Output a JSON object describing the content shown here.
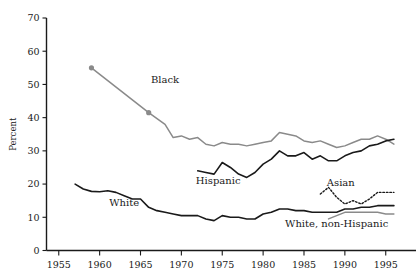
{
  "chart_data": {
    "type": "line",
    "title": "",
    "xlabel": "",
    "ylabel": "Percent",
    "xlim": [
      1953.5,
      1996.5
    ],
    "ylim": [
      0,
      70
    ],
    "grid": false,
    "legend": "inline-annotations",
    "xticks": [
      1955,
      1960,
      1965,
      1970,
      1975,
      1980,
      1985,
      1990,
      1995
    ],
    "yticks": [
      0,
      10,
      20,
      30,
      40,
      50,
      60,
      70
    ],
    "xtick_labels": [
      "1955",
      "1960",
      "1965",
      "1970",
      "1975",
      "1980",
      "1985",
      "1990",
      "1995"
    ],
    "ytick_labels": [
      "0",
      "10",
      "20",
      "30",
      "40",
      "50",
      "60",
      "70"
    ],
    "series": [
      {
        "name": "Black",
        "label": "Black",
        "color": "#8a8a8a",
        "style": "solid",
        "width": 1.5,
        "markers": [
          {
            "x": 1959,
            "y": 55.0
          },
          {
            "x": 1966,
            "y": 41.5
          }
        ],
        "label_x": 1968.0,
        "label_y": 50.5,
        "x": [
          1959,
          1966,
          1968,
          1969,
          1970,
          1971,
          1972,
          1973,
          1974,
          1975,
          1976,
          1977,
          1978,
          1979,
          1980,
          1981,
          1982,
          1983,
          1984,
          1985,
          1986,
          1987,
          1988,
          1989,
          1990,
          1991,
          1992,
          1993,
          1994,
          1995,
          1996
        ],
        "y": [
          55.0,
          41.5,
          38.0,
          34.0,
          34.5,
          33.5,
          34.0,
          32.0,
          31.5,
          32.5,
          32.0,
          32.0,
          31.5,
          32.0,
          32.5,
          33.0,
          35.5,
          35.0,
          34.5,
          33.0,
          32.5,
          33.0,
          32.0,
          31.0,
          31.5,
          32.5,
          33.5,
          33.5,
          34.5,
          33.5,
          32.0
        ]
      },
      {
        "name": "Hispanic",
        "label": "Hispanic",
        "color": "#1a1a1a",
        "style": "solid",
        "width": 1.6,
        "markers": [],
        "label_x": 1974.5,
        "label_y": 20.0,
        "x": [
          1972,
          1973,
          1974,
          1975,
          1976,
          1977,
          1978,
          1979,
          1980,
          1981,
          1982,
          1983,
          1984,
          1985,
          1986,
          1987,
          1988,
          1989,
          1990,
          1991,
          1992,
          1993,
          1994,
          1995,
          1996
        ],
        "y": [
          24.0,
          23.5,
          23.0,
          26.5,
          25.0,
          23.0,
          22.0,
          23.5,
          26.0,
          27.5,
          30.0,
          28.5,
          28.5,
          29.5,
          27.5,
          28.5,
          27.0,
          27.0,
          28.5,
          29.5,
          30.0,
          31.5,
          32.0,
          33.0,
          33.5
        ]
      },
      {
        "name": "White",
        "label": "White",
        "color": "#1a1a1a",
        "style": "solid",
        "width": 1.6,
        "markers": [],
        "label_x": 1963.0,
        "label_y": 13.5,
        "x": [
          1957,
          1958,
          1959,
          1960,
          1961,
          1962,
          1963,
          1964,
          1965,
          1966,
          1967,
          1968,
          1969,
          1970,
          1971,
          1972,
          1973,
          1974,
          1975,
          1976,
          1977,
          1978,
          1979,
          1980,
          1981,
          1982,
          1983,
          1984,
          1985,
          1986,
          1987,
          1988,
          1989,
          1990,
          1991,
          1992,
          1993,
          1994,
          1995,
          1996
        ],
        "y": [
          20.0,
          18.5,
          17.8,
          17.7,
          18.0,
          17.5,
          16.5,
          15.5,
          15.5,
          13.0,
          12.0,
          11.5,
          11.0,
          10.5,
          10.5,
          10.5,
          9.5,
          9.0,
          10.5,
          10.0,
          10.0,
          9.5,
          9.5,
          11.0,
          11.5,
          12.5,
          12.5,
          12.0,
          12.0,
          11.5,
          11.5,
          11.5,
          11.5,
          12.5,
          12.5,
          13.0,
          13.0,
          13.5,
          13.5,
          13.5
        ]
      },
      {
        "name": "Asian",
        "label": "Asian",
        "color": "#1a1a1a",
        "style": "dotted",
        "width": 1.4,
        "markers": [],
        "label_x": 1989.5,
        "label_y": 19.5,
        "x": [
          1987,
          1988,
          1989,
          1990,
          1991,
          1992,
          1993,
          1994,
          1995,
          1996
        ],
        "y": [
          17.0,
          19.0,
          16.0,
          14.0,
          15.0,
          14.0,
          15.5,
          17.5,
          17.5,
          17.5
        ]
      },
      {
        "name": "White, non-Hispanic",
        "label": "White, non-Hispanic",
        "color": "#8a8a8a",
        "style": "solid",
        "width": 1.4,
        "markers": [],
        "label_x": 1989.0,
        "label_y": 7.0,
        "x": [
          1988,
          1989,
          1990,
          1991,
          1992,
          1993,
          1994,
          1995,
          1996
        ],
        "y": [
          9.5,
          10.5,
          11.5,
          11.5,
          11.5,
          11.5,
          11.5,
          11.0,
          11.0
        ]
      }
    ]
  },
  "axis": {
    "y_title": "Percent"
  }
}
